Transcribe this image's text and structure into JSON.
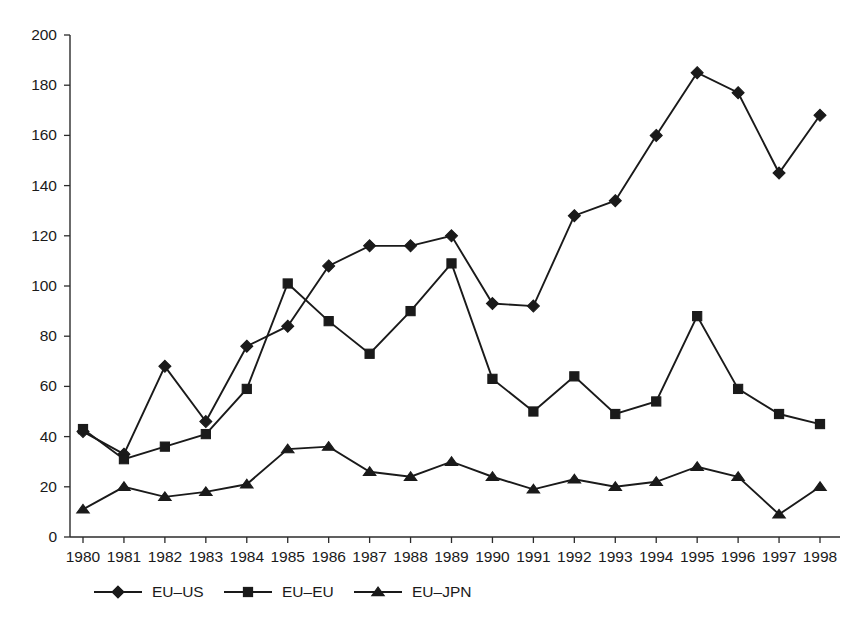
{
  "chart_data": {
    "type": "line",
    "title": "",
    "subtitle": "",
    "xlabel": "",
    "ylabel": "",
    "categories": [
      "1980",
      "1981",
      "1982",
      "1983",
      "1984",
      "1985",
      "1986",
      "1987",
      "1988",
      "1989",
      "1990",
      "1991",
      "1992",
      "1993",
      "1994",
      "1995",
      "1996",
      "1997",
      "1998"
    ],
    "x": [
      1980,
      1981,
      1982,
      1983,
      1984,
      1985,
      1986,
      1987,
      1988,
      1989,
      1990,
      1991,
      1992,
      1993,
      1994,
      1995,
      1996,
      1997,
      1998
    ],
    "series": [
      {
        "name": "EU–US",
        "marker": "diamond",
        "values": [
          42,
          33,
          68,
          46,
          76,
          84,
          108,
          116,
          116,
          120,
          93,
          92,
          128,
          134,
          160,
          185,
          177,
          145,
          168
        ]
      },
      {
        "name": "EU–EU",
        "marker": "square",
        "values": [
          43,
          31,
          36,
          41,
          59,
          101,
          86,
          73,
          90,
          109,
          63,
          50,
          64,
          49,
          54,
          88,
          59,
          49,
          45
        ]
      },
      {
        "name": "EU–JPN",
        "marker": "triangle",
        "values": [
          11,
          20,
          16,
          18,
          21,
          35,
          36,
          26,
          24,
          30,
          24,
          19,
          23,
          20,
          22,
          28,
          24,
          9,
          20
        ]
      }
    ],
    "ylim": [
      0,
      200
    ],
    "yticks": [
      0,
      20,
      40,
      60,
      80,
      100,
      120,
      140,
      160,
      180,
      200
    ],
    "ytick_labels": [
      "0",
      "20",
      "40",
      "60",
      "80",
      "100",
      "120",
      "140",
      "160",
      "180",
      "200"
    ],
    "grid": false,
    "legend_position": "bottom"
  },
  "legend": {
    "items": [
      {
        "label": "EU–US",
        "marker": "diamond"
      },
      {
        "label": "EU–EU",
        "marker": "square"
      },
      {
        "label": "EU–JPN",
        "marker": "triangle"
      }
    ]
  },
  "colors": {
    "ink": "#1a1a1a",
    "axis": "#2b2b2b",
    "background": "#ffffff"
  },
  "caption": {
    "partial_text": ""
  }
}
